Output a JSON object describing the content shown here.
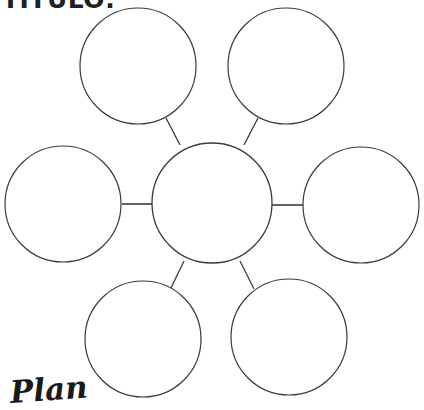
{
  "page": {
    "background_color": "#ffffff",
    "width": 424,
    "height": 410
  },
  "header": {
    "title_label": "TÍTULO:",
    "title_color": "#231f20",
    "note": "cropped at top edge of page"
  },
  "watermark": {
    "label": "Plan",
    "color": "#1a1a1a",
    "note": "handwritten logo clipped by bottom edge"
  },
  "diagram": {
    "type": "bubble-map",
    "stroke_color": "#3a3a3a",
    "fill_color": "#ffffff",
    "stroke_width": 1.2,
    "center_node": {
      "label": "",
      "cx": 212,
      "cy": 203,
      "r": 60
    },
    "outer_nodes": [
      {
        "name": "top-left",
        "label": "",
        "cx": 138,
        "cy": 66,
        "r": 58
      },
      {
        "name": "top-right",
        "label": "",
        "cx": 286,
        "cy": 66,
        "r": 58
      },
      {
        "name": "left",
        "label": "",
        "cx": 63,
        "cy": 204,
        "r": 58
      },
      {
        "name": "right",
        "label": "",
        "cx": 361,
        "cy": 205,
        "r": 58
      },
      {
        "name": "bottom-left",
        "label": "",
        "cx": 143,
        "cy": 339,
        "r": 58
      },
      {
        "name": "bottom-right",
        "label": "",
        "cx": 289,
        "cy": 337,
        "r": 58
      }
    ],
    "connectors": [
      {
        "name": "center-to-top-left",
        "x1": 180,
        "y1": 145,
        "x2": 166,
        "y2": 118
      },
      {
        "name": "center-to-top-right",
        "x1": 244,
        "y1": 145,
        "x2": 258,
        "y2": 118
      },
      {
        "name": "center-to-left",
        "x1": 152,
        "y1": 204,
        "x2": 122,
        "y2": 204
      },
      {
        "name": "center-to-right",
        "x1": 272,
        "y1": 205,
        "x2": 303,
        "y2": 205
      },
      {
        "name": "center-to-bottom-left",
        "x1": 184,
        "y1": 261,
        "x2": 170,
        "y2": 290
      },
      {
        "name": "center-to-bottom-right",
        "x1": 240,
        "y1": 261,
        "x2": 254,
        "y2": 289
      }
    ]
  }
}
